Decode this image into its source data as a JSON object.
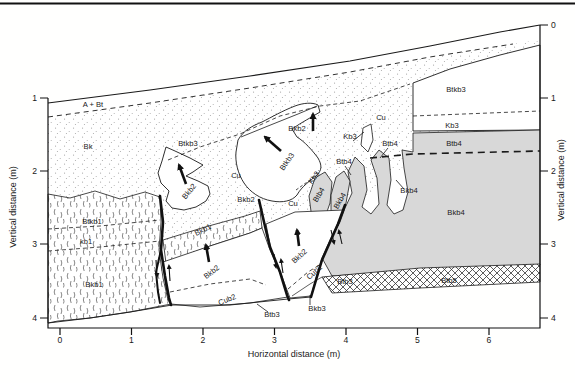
{
  "figure": {
    "kind": "trench-log cross-section of soil horizons with faults and displacement arrows"
  },
  "axes": {
    "x": {
      "label": "Horizontal distance (m)",
      "ticks": [
        "0",
        "1",
        "2",
        "3",
        "4",
        "5",
        "6"
      ]
    },
    "y_left": {
      "label": "Vertical distance (m)",
      "ticks": [
        "1",
        "2",
        "3",
        "4"
      ]
    },
    "y_right": {
      "label": "Vertical distance (m)",
      "ticks": [
        "0",
        "1",
        "2",
        "3",
        "4"
      ]
    }
  },
  "units": [
    {
      "id": "a-bt",
      "label": "A + Bt"
    },
    {
      "id": "bk",
      "label": "Bk"
    },
    {
      "id": "btkb3-upper",
      "label": "Btkb3"
    },
    {
      "id": "bkb2-west",
      "label": "Bkb2"
    },
    {
      "id": "cu-west",
      "label": "Cu"
    },
    {
      "id": "bkb2-mid",
      "label": "Bkb2"
    },
    {
      "id": "btkb3-center",
      "label": "Btkb3"
    },
    {
      "id": "bkb2-top",
      "label": "Bkb2"
    },
    {
      "id": "cu-top",
      "label": "Cu"
    },
    {
      "id": "kb3-top",
      "label": "Kb3"
    },
    {
      "id": "btb4-top",
      "label": "Btb4"
    },
    {
      "id": "btkb3-east",
      "label": "Btkb3"
    },
    {
      "id": "kb3-east",
      "label": "Kb3"
    },
    {
      "id": "btb4-east",
      "label": "Btb4"
    },
    {
      "id": "btb4-mid",
      "label": "Btb4"
    },
    {
      "id": "kb3-rot",
      "label": "Kb3"
    },
    {
      "id": "btb4-rot",
      "label": "Btb4"
    },
    {
      "id": "bkb4-rot",
      "label": "Bkb4"
    },
    {
      "id": "bkb4-mid",
      "label": "Bkb4"
    },
    {
      "id": "bkb4-east",
      "label": "Bkb4"
    },
    {
      "id": "cu-center",
      "label": "Cu"
    },
    {
      "id": "bkb2-block-w",
      "label": "Bkb2"
    },
    {
      "id": "cub2-w",
      "label": "Cub2"
    },
    {
      "id": "bkb2-block-e",
      "label": "Bkb2"
    },
    {
      "id": "cub2-e",
      "label": "Cub2"
    },
    {
      "id": "btb3-band",
      "label": "Btb3"
    },
    {
      "id": "btb5",
      "label": "Btb5"
    },
    {
      "id": "bkb3-bottom",
      "label": "Bkb3"
    },
    {
      "id": "btb3-bottom",
      "label": "Btb3"
    },
    {
      "id": "btkb1",
      "label": "Btkb1"
    },
    {
      "id": "kb1",
      "label": "kb1"
    },
    {
      "id": "bkb1-west",
      "label": "Bkb1"
    },
    {
      "id": "bkb1-band",
      "label": "Bkb1"
    }
  ],
  "colors": {
    "line": "#1a1a1a",
    "gray_fill": "#d8d8d8",
    "stipple_dot": "#999999",
    "background": "#ffffff"
  }
}
